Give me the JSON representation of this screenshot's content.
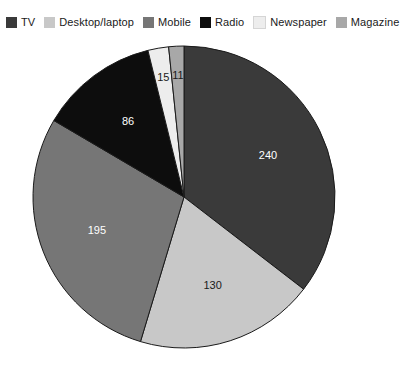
{
  "chart_data": {
    "type": "pie",
    "title": "",
    "subtitle": "",
    "xlabel": "",
    "ylabel": "",
    "total": 677,
    "legend_position": "top-left",
    "grid": false,
    "start_angle_deg": 0,
    "direction": "clockwise",
    "categories": [
      "TV",
      "Desktop/laptop",
      "Mobile",
      "Radio",
      "Newspaper",
      "Magazine"
    ],
    "values": [
      240,
      130,
      195,
      86,
      15,
      11
    ],
    "colors": [
      "#3a3a3a",
      "#c8c8c8",
      "#767676",
      "#0d0d0d",
      "#ededed",
      "#a8a8a8"
    ],
    "label_colors": [
      "light",
      "dark",
      "light",
      "light",
      "dark",
      "dark"
    ],
    "slices": [
      {
        "label": "TV",
        "value": 240,
        "value_text": "240",
        "color": "#3a3a3a",
        "label_color": "light"
      },
      {
        "label": "Desktop/laptop",
        "value": 130,
        "value_text": "130",
        "color": "#c8c8c8",
        "label_color": "dark"
      },
      {
        "label": "Mobile",
        "value": 195,
        "value_text": "195",
        "color": "#767676",
        "label_color": "light"
      },
      {
        "label": "Radio",
        "value": 86,
        "value_text": "86",
        "color": "#0d0d0d",
        "label_color": "light"
      },
      {
        "label": "Newspaper",
        "value": 15,
        "value_text": "15",
        "color": "#ededed",
        "label_color": "dark"
      },
      {
        "label": "Magazine",
        "value": 11,
        "value_text": "11",
        "color": "#a8a8a8",
        "label_color": "dark"
      }
    ]
  },
  "legend": {
    "items": [
      {
        "label": "TV",
        "color": "#3a3a3a"
      },
      {
        "label": "Desktop/laptop",
        "color": "#c8c8c8"
      },
      {
        "label": "Mobile",
        "color": "#767676"
      },
      {
        "label": "Radio",
        "color": "#0d0d0d"
      },
      {
        "label": "Newspaper",
        "color": "#ededed"
      },
      {
        "label": "Magazine",
        "color": "#a8a8a8"
      }
    ]
  },
  "geometry": {
    "center_x": 184,
    "center_y": 197,
    "radius": 151,
    "outline_color": "#1a1a1a"
  },
  "background": "#ffffff"
}
